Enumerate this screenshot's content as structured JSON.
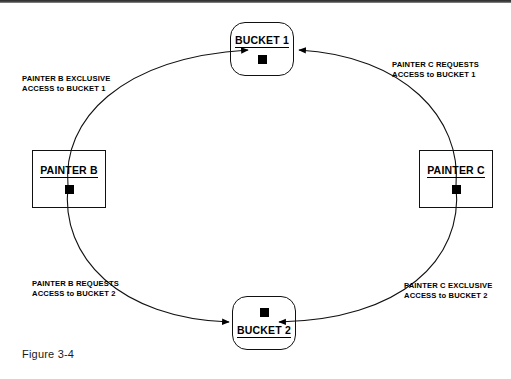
{
  "figure": {
    "caption": "Figure 3-4",
    "type": "resource-allocation-deadlock-cycle"
  },
  "nodes": {
    "bucket1": {
      "label": "BUCKET 1",
      "shape": "rounded-rect",
      "label_position": "above",
      "token": "filled-square"
    },
    "bucket2": {
      "label": "BUCKET 2",
      "shape": "rounded-rect",
      "label_position": "below",
      "token": "filled-square"
    },
    "painter_b": {
      "label": "PAINTER B",
      "shape": "rect",
      "label_position": "above",
      "token": "filled-square"
    },
    "painter_c": {
      "label": "PAINTER C",
      "shape": "rect",
      "label_position": "above",
      "token": "filled-square"
    }
  },
  "annotations": {
    "b_exclusive_bucket1": "PAINTER B EXCLUSIVE\nACCESS to BUCKET 1",
    "c_requests_bucket1": "PAINTER C REQUESTS\nACCESS to BUCKET 1",
    "b_requests_bucket2": "PAINTER B REQUESTS\nACCESS to BUCKET 2",
    "c_exclusive_bucket2": "PAINTER C EXCLUSIVE\nACCESS to BUCKET 2"
  },
  "edges": [
    {
      "name": "painter-b-to-bucket1",
      "from": "painter_b",
      "to": "bucket1",
      "arrow": "to-bucket1-left"
    },
    {
      "name": "painter-c-to-bucket1",
      "from": "painter_c",
      "to": "bucket1",
      "arrow": "to-bucket1-right"
    },
    {
      "name": "painter-b-to-bucket2",
      "from": "painter_b",
      "to": "bucket2",
      "arrow": "to-bucket2-left"
    },
    {
      "name": "painter-c-to-bucket2",
      "from": "painter_c",
      "to": "bucket2",
      "arrow": "to-bucket2-right"
    }
  ],
  "colors": {
    "ink": "#000000",
    "background": "#ffffff",
    "caption": "#1a1a1a"
  }
}
